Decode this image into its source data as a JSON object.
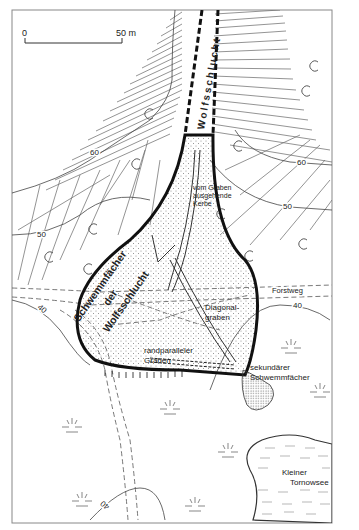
{
  "map": {
    "scale_bar": {
      "start": "0",
      "end": "50 m"
    },
    "channel_label": "Wolfsschlucht",
    "fan_label": [
      "Schwemmfächer",
      "der",
      "Wolfsschlucht"
    ],
    "labels": {
      "kerbe": [
        "vom Graben",
        "ausgehende",
        "Kerbe"
      ],
      "diagonal": [
        "Diagonal-",
        "graben"
      ],
      "randparallel": [
        "randparalleler",
        "Graben"
      ],
      "forstweg": "Forstweg",
      "sekundaer": [
        "sekundärer",
        "Schwemmfächer"
      ],
      "lake": [
        "Kleiner",
        "Tornowsee"
      ]
    },
    "contours": {
      "c60_left": "60",
      "c50_left": "50",
      "c60_right": "60",
      "c50_right": "50",
      "c40_right": "40",
      "c40_left": "40",
      "c40_bottom": "40"
    },
    "colors": {
      "ink": "#111111",
      "line": "#555555",
      "frame": "#777777",
      "stipple": "#888888"
    }
  }
}
